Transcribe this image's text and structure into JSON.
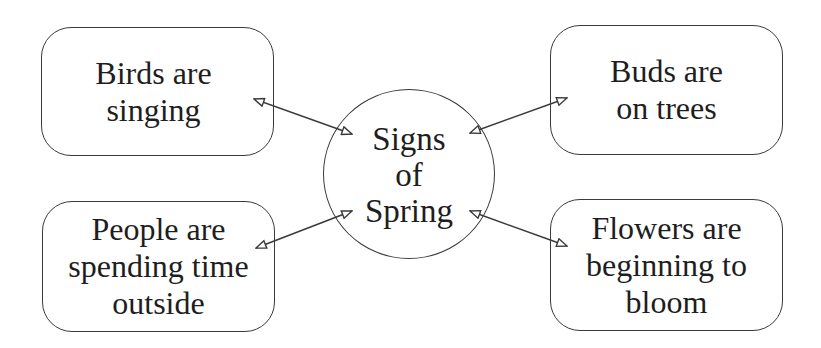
{
  "diagram": {
    "type": "concept-map",
    "colors": {
      "stroke": "#3a3a3a",
      "text": "#1e1e1e",
      "background": "#ffffff"
    },
    "center": {
      "label": "Signs\nof\nSpring",
      "shape": "circle"
    },
    "nodes": [
      {
        "id": "top-left",
        "label": "Birds are\nsinging",
        "shape": "rounded-rectangle"
      },
      {
        "id": "top-right",
        "label": "Buds are\non trees",
        "shape": "rounded-rectangle"
      },
      {
        "id": "bottom-left",
        "label": "People are\nspending time\noutside",
        "shape": "rounded-rectangle"
      },
      {
        "id": "bottom-right",
        "label": "Flowers are\nbeginning to\nbloom",
        "shape": "rounded-rectangle"
      }
    ],
    "edges": [
      {
        "from": "center",
        "to": "top-left",
        "style": "double-headed-open-arrow"
      },
      {
        "from": "center",
        "to": "top-right",
        "style": "double-headed-open-arrow"
      },
      {
        "from": "center",
        "to": "bottom-left",
        "style": "double-headed-open-arrow"
      },
      {
        "from": "center",
        "to": "bottom-right",
        "style": "double-headed-open-arrow"
      }
    ]
  }
}
